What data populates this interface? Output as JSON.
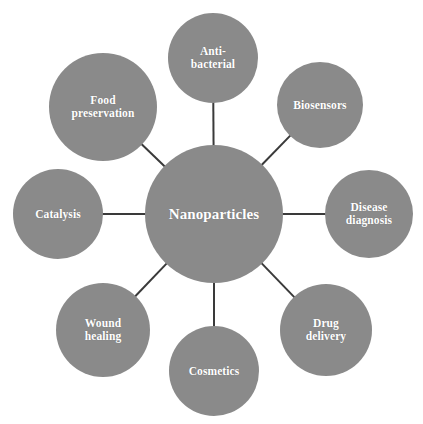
{
  "diagram": {
    "type": "hub-and-spoke",
    "colors": {
      "node_fill": "#8a8a8a",
      "node_text": "#ffffff",
      "connector": "#3a3a3a",
      "background": "#ffffff"
    },
    "center": {
      "label": "Nanoparticles",
      "cx": 214,
      "cy": 214,
      "r": 69
    },
    "satellites": [
      {
        "id": "anti-bacterial",
        "label": "Anti-\nbacterial",
        "cx": 213,
        "cy": 58,
        "r": 45
      },
      {
        "id": "biosensors",
        "label": "Biosensors",
        "cx": 320,
        "cy": 105,
        "r": 43
      },
      {
        "id": "disease-diagnosis",
        "label": "Disease\ndiagnosis",
        "cx": 369,
        "cy": 214,
        "r": 44
      },
      {
        "id": "drug-delivery",
        "label": "Drug\ndelivery",
        "cx": 326,
        "cy": 330,
        "r": 46
      },
      {
        "id": "cosmetics",
        "label": "Cosmetics",
        "cx": 214,
        "cy": 371,
        "r": 45
      },
      {
        "id": "wound-healing",
        "label": "Wound\nhealing",
        "cx": 103,
        "cy": 330,
        "r": 47
      },
      {
        "id": "catalysis",
        "label": "Catalysis",
        "cx": 58,
        "cy": 214,
        "r": 45
      },
      {
        "id": "food-preservation",
        "label": "Food\npreservation",
        "cx": 103,
        "cy": 107,
        "r": 54
      }
    ]
  }
}
